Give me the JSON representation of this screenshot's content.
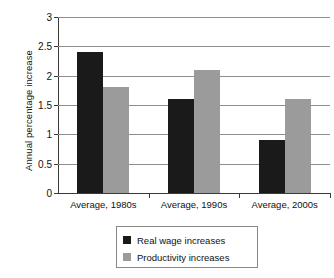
{
  "chart_data": {
    "type": "bar",
    "title": "",
    "xlabel": "",
    "ylabel": "Annual percentage increase",
    "categories": [
      "Average, 1980s",
      "Average, 1990s",
      "Average, 2000s"
    ],
    "series": [
      {
        "name": "Real wage increases",
        "color": "#1a1a1a",
        "values": [
          2.4,
          1.6,
          0.9
        ]
      },
      {
        "name": "Productivity increases",
        "color": "#9b9b9b",
        "values": [
          1.8,
          2.1,
          1.6
        ]
      }
    ],
    "ylim": [
      0,
      3
    ],
    "ytick_step": 0.5,
    "ytick_labels": [
      "0",
      "0.5",
      "1",
      "1.5",
      "2",
      "2.5",
      "3"
    ],
    "ytick_values": [
      0,
      0.5,
      1,
      1.5,
      2,
      2.5,
      3
    ],
    "grid": true,
    "legend_position": "bottom-center"
  }
}
